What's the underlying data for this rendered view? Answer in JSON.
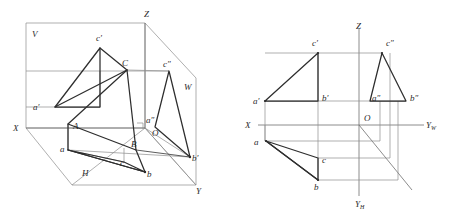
{
  "figure": {
    "colors": {
      "bold_line": "#2e2e2e",
      "thin_line": "#8c8c8c",
      "axis_line": "#6e6e6e",
      "background": "#ffffff",
      "label_text": "#2b2b2b"
    },
    "left_view": {
      "name": "pictorial-projection-box",
      "plane_labels": [
        {
          "id": "plane-v",
          "text": "V",
          "x": 32,
          "y": 37
        },
        {
          "id": "plane-h",
          "text": "H",
          "x": 82,
          "y": 176
        },
        {
          "id": "plane-w",
          "text": "W",
          "x": 184,
          "y": 90
        }
      ],
      "axis_labels": [
        {
          "id": "axis-x",
          "text": "X",
          "x": 13,
          "y": 131
        },
        {
          "id": "axis-y",
          "text": "Y",
          "x": 196,
          "y": 194
        },
        {
          "id": "axis-z",
          "text": "Z",
          "x": 144,
          "y": 17
        },
        {
          "id": "origin-o",
          "text": "O",
          "x": 152,
          "y": 136
        }
      ],
      "point_labels": [
        {
          "id": "point-A",
          "text": "A",
          "x": 73,
          "y": 129
        },
        {
          "id": "point-B",
          "text": "B",
          "x": 131,
          "y": 147
        },
        {
          "id": "point-C",
          "text": "C",
          "x": 122,
          "y": 66
        },
        {
          "id": "point-a-front",
          "text": "a′",
          "x": 33,
          "y": 110
        },
        {
          "id": "point-b-front",
          "text": "b′",
          "x": 192,
          "y": 161
        },
        {
          "id": "point-c-front",
          "text": "c′",
          "x": 96,
          "y": 41
        },
        {
          "id": "point-a-top",
          "text": "a",
          "x": 60,
          "y": 152
        },
        {
          "id": "point-b-top",
          "text": "b",
          "x": 147,
          "y": 177
        },
        {
          "id": "point-c-top",
          "text": "c",
          "x": 120,
          "y": 166
        },
        {
          "id": "point-a-side",
          "text": "a″",
          "x": 146,
          "y": 123
        },
        {
          "id": "point-c-side",
          "text": "c″",
          "x": 163,
          "y": 67
        }
      ]
    },
    "right_view": {
      "name": "orthographic-three-view",
      "axis_labels": [
        {
          "id": "axis-x",
          "text": "X",
          "x": 245,
          "y": 128
        },
        {
          "id": "axis-z",
          "text": "Z",
          "x": 356,
          "y": 29
        },
        {
          "id": "axis-yw",
          "text": "Y",
          "sub": "W",
          "x": 426,
          "y": 128
        },
        {
          "id": "axis-yh",
          "text": "Y",
          "sub": "H",
          "x": 355,
          "y": 207
        },
        {
          "id": "origin-o",
          "text": "O",
          "x": 364,
          "y": 121
        }
      ],
      "point_labels": [
        {
          "id": "point-a-front",
          "text": "a′",
          "x": 253,
          "y": 104
        },
        {
          "id": "point-b-front",
          "text": "b′",
          "x": 322,
          "y": 101
        },
        {
          "id": "point-c-front",
          "text": "c′",
          "x": 312,
          "y": 46
        },
        {
          "id": "point-a-side",
          "text": "a″",
          "x": 372,
          "y": 101
        },
        {
          "id": "point-b-side",
          "text": "b″",
          "x": 410,
          "y": 101
        },
        {
          "id": "point-c-side",
          "text": "c″",
          "x": 386,
          "y": 46
        },
        {
          "id": "point-a-top",
          "text": "a",
          "x": 254,
          "y": 145
        },
        {
          "id": "point-b-top",
          "text": "b",
          "x": 314,
          "y": 190
        },
        {
          "id": "point-c-top",
          "text": "c",
          "x": 322,
          "y": 163
        }
      ]
    }
  }
}
